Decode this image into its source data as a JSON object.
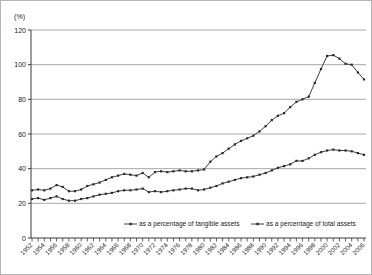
{
  "chart_data": {
    "type": "line",
    "title": "",
    "xlabel": "",
    "ylabel": "(%)",
    "ylim": [
      0,
      120
    ],
    "ytick_step": 20,
    "yticks": [
      0,
      20,
      40,
      60,
      80,
      100,
      120
    ],
    "grid": true,
    "legend_position": "bottom-inside",
    "x_tick_label_step": 2,
    "x": [
      1952,
      1953,
      1954,
      1955,
      1956,
      1957,
      1958,
      1959,
      1960,
      1961,
      1962,
      1963,
      1964,
      1965,
      1966,
      1967,
      1968,
      1969,
      1970,
      1971,
      1972,
      1973,
      1974,
      1975,
      1976,
      1977,
      1978,
      1979,
      1980,
      1981,
      1982,
      1983,
      1984,
      1985,
      1986,
      1987,
      1988,
      1989,
      1990,
      1991,
      1992,
      1993,
      1994,
      1995,
      1996,
      1997,
      1998,
      1999,
      2000,
      2001,
      2002,
      2003,
      2004,
      2005,
      2006
    ],
    "series": [
      {
        "name": "as a percentage of tangible assets",
        "marker": "square",
        "color": "#2a2a2a",
        "values": [
          27.5,
          28,
          27.5,
          28.5,
          30.5,
          29.5,
          27,
          27,
          28,
          30,
          31,
          32,
          33.5,
          35,
          36,
          37,
          36.5,
          36,
          37.5,
          35,
          38,
          38.5,
          38,
          38.5,
          39,
          38.5,
          38.5,
          39,
          39.5,
          44,
          47,
          49,
          51.5,
          54,
          56,
          57.5,
          59,
          61.5,
          64.5,
          68,
          70.5,
          72,
          75.5,
          78.5,
          80,
          81.5,
          89.5,
          97.5,
          105,
          105.5,
          103.5,
          100.5,
          100,
          95.5,
          91.5
        ]
      },
      {
        "name": "as a percentage of total assets",
        "marker": "square",
        "color": "#2a2a2a",
        "values": [
          22.5,
          23,
          22,
          23,
          24,
          22.5,
          21.5,
          21.5,
          22.5,
          23,
          24,
          25,
          25.5,
          26,
          27,
          27.5,
          27.5,
          28,
          28.5,
          26.5,
          27,
          26.5,
          27,
          27.5,
          28,
          28.5,
          28.5,
          27.5,
          28,
          29,
          30,
          31.5,
          32.5,
          33.5,
          34.5,
          35,
          35.5,
          36.5,
          37.5,
          39,
          40.5,
          41.5,
          42.5,
          44.5,
          44.5,
          46,
          48,
          49.5,
          50.5,
          51,
          50.5,
          50.5,
          50,
          49,
          48
        ]
      }
    ],
    "colors": {
      "line": "#2a2a2a",
      "grid": "#9e9e9e",
      "axis": "#3a3a3a",
      "background": "#ffffff"
    }
  }
}
